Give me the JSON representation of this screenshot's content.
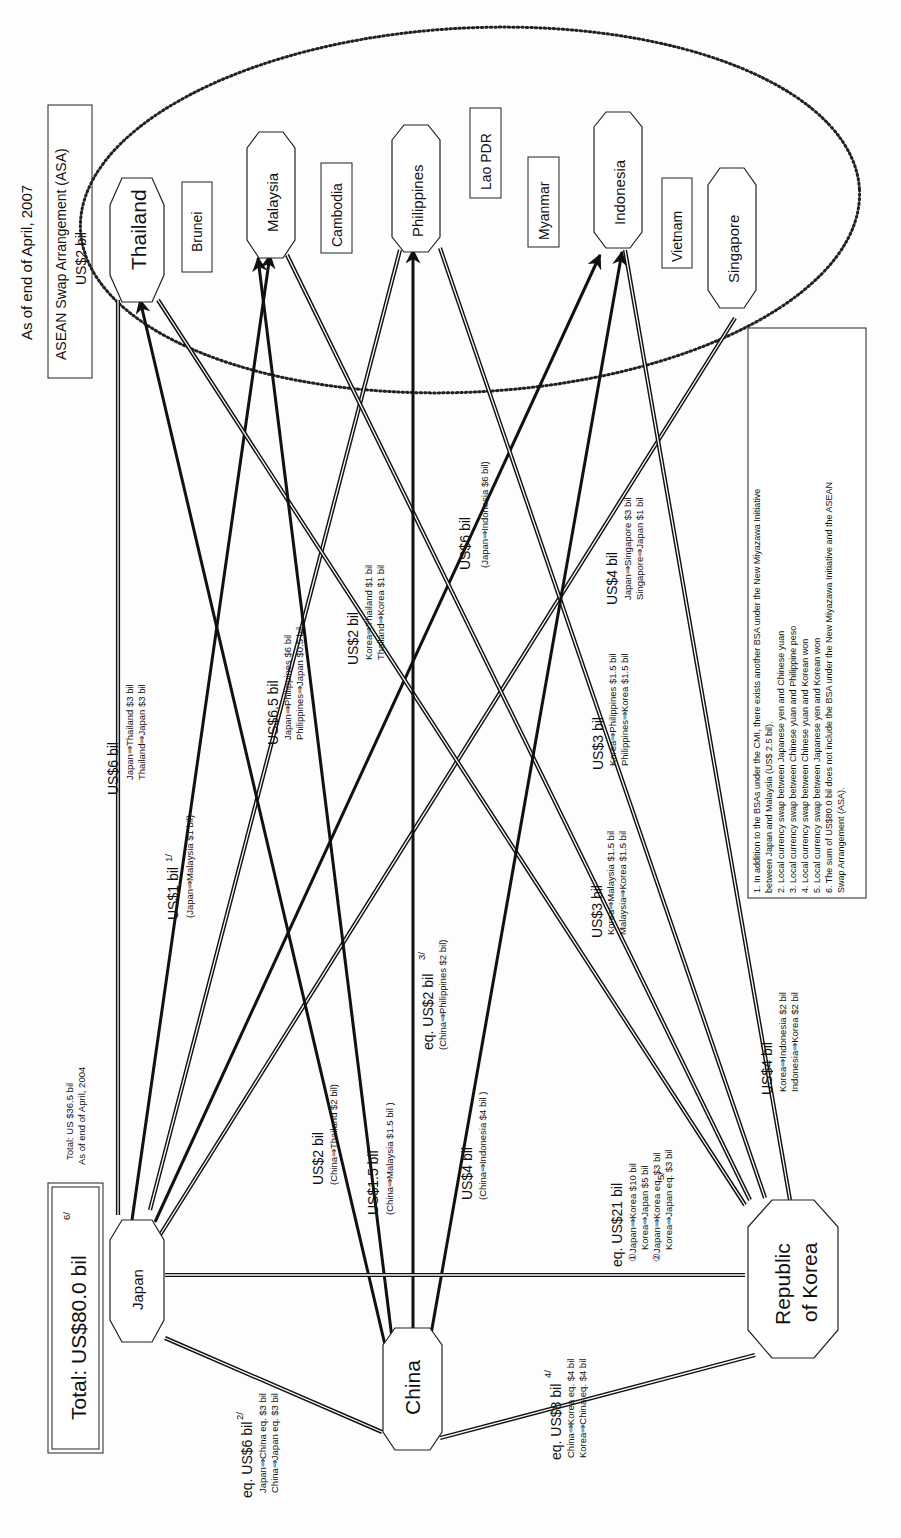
{
  "header": {
    "date": "As of end of April, 2007",
    "asa_title": "ASEAN Swap Arrangement (ASA)",
    "asa_amount": "US$2 bil"
  },
  "total": {
    "label": "Total: US$80.0 bil",
    "footnote": "6/",
    "previous_line1": "Total: US $36.5 bil",
    "previous_line2": "As of end of April, 2004"
  },
  "nodes": {
    "japan": "Japan",
    "china": "China",
    "korea_line1": "Republic",
    "korea_line2": "of Korea",
    "thailand": "Thailand",
    "malaysia": "Malaysia",
    "philippines": "Philippines",
    "indonesia": "Indonesia",
    "singapore": "Singapore",
    "brunei": "Brunei",
    "cambodia": "Cambodia",
    "lao": "Lao PDR",
    "myanmar": "Myanmar",
    "vietnam": "Vietnam"
  },
  "swaps": {
    "japan_thailand": {
      "amount": "US$6 bil",
      "d1": "Japan⇒Thailand $3 bil",
      "d2": "Thailand⇒Japan $3 bil"
    },
    "japan_malaysia": {
      "amount": "US$1 bil",
      "fn": "1/",
      "d1": "(Japan⇒Malaysia $1 bil)"
    },
    "japan_philippines": {
      "amount": "US$6.5 bil",
      "d1": "Japan⇒Philippines $6 bil",
      "d2": "Philippines⇒Japan $0.5 bil"
    },
    "japan_indonesia": {
      "amount": "US$6 bil",
      "d1": "(Japan⇒Indonesia $6 bil)"
    },
    "japan_singapore": {
      "amount": "US$4 bil",
      "d1": "Japan⇒Singapore $3 bil",
      "d2": "Singapore⇒Japan $1 bil"
    },
    "korea_thailand": {
      "amount": "US$2 bil",
      "d1": "Korea⇒Thailand $1 bil",
      "d2": "Thailand⇒Korea $1 bil"
    },
    "korea_malaysia": {
      "amount": "US$3 bil",
      "d1": "Korea⇒Malaysia $1.5 bil",
      "d2": "Malaysia⇒Korea $1.5 bil"
    },
    "korea_philippines": {
      "amount": "US$3 bil",
      "d1": "Korea⇒Philippines $1.5 bil",
      "d2": "Philippines⇒Korea $1.5 bil"
    },
    "korea_indonesia": {
      "amount": "US$4 bil",
      "d1": "Korea⇒Indonesia $2 bil",
      "d2": "Indonesia⇒Korea $2 bil"
    },
    "china_thailand": {
      "amount": "US$2 bil",
      "d1": "(China⇒Thailand $2 bil)"
    },
    "china_malaysia": {
      "amount": "US$1.5 bil",
      "d1": "(China⇒Malaysia $1.5 bil )"
    },
    "china_philippines": {
      "amount": "eq. US$2 bil",
      "fn": "3/",
      "d1": "(China⇒Philippines $2 bil)"
    },
    "china_indonesia": {
      "amount": "US$4 bil",
      "d1": "(China⇒Indonesia $4 bil )"
    },
    "japan_china": {
      "amount": "eq. US$6 bil",
      "fn": "2/",
      "d1": "Japan⇒China eq. $3 bil",
      "d2": "China⇒Japan eq. $3 bil"
    },
    "china_korea": {
      "amount": "eq. US$8 bil",
      "fn": "4/",
      "d1": "China⇒Korea eq. $4 bil",
      "d2": "Korea⇒China eq. $4 bil"
    },
    "japan_korea": {
      "amount": "eq. US$21 bil",
      "fn": "5/",
      "d1": "①Japan⇒Korea $10 bil",
      "d2": "Korea⇒Japan $5 bil",
      "d3": "②Japan⇒Korea eq. $3 bil",
      "d4": "Korea⇒Japan eq. $3 bil"
    }
  },
  "notes": [
    "1.  In addition to the BSAs under the CMI, there exists another BSA under the New Miyazawa Initiative",
    "     between Japan and Malaysia (US$ 2.5 bil).",
    "2.  Local currency swap between Japanese yen and Chinese yuan",
    "3.  Local currency swap between Chinese yuan and Philippine peso",
    "4.  Local currency swap between Chinese yuan and Korean won",
    "5.  Local currency swap between Japanese yen and Korean won",
    "6.  The sum of US$80.0 bil does not include the BSA under the New Miyazawa Initiative and the ASEAN",
    "     Swap Arrangement (ASA)."
  ]
}
